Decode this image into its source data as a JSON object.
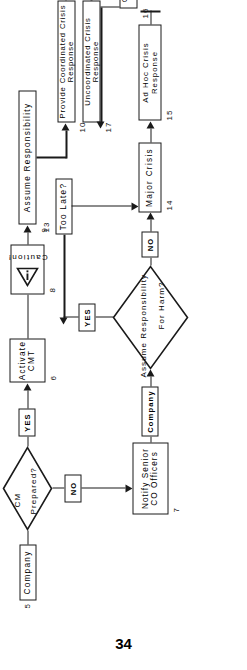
{
  "document": {
    "page_number": "34",
    "type": "flowchart",
    "orientation": "landscape-rotated"
  },
  "flowchart": {
    "nodes": [
      {
        "id": "5",
        "num": "5",
        "label": "Company",
        "shape": "rectangle"
      },
      {
        "id": "d1",
        "num": "",
        "label": "CM Prepared?",
        "shape": "diamond",
        "line1": "CM",
        "line2": "Prepared?"
      },
      {
        "id": "6",
        "num": "6",
        "label": "Activate CMT",
        "shape": "rectangle",
        "line1": "Activate",
        "line2": "CMT"
      },
      {
        "id": "8",
        "num": "8",
        "label": "Caution!",
        "shape": "rectangle-icon",
        "icon": "caution-triangle-icon"
      },
      {
        "id": "9",
        "num": "9",
        "label": "Assume Responsibility",
        "shape": "rectangle"
      },
      {
        "id": "10",
        "num": "10",
        "label": "Provide Coordinated Crisis Response",
        "shape": "rectangle"
      },
      {
        "id": "11",
        "num": "11",
        "label": "2",
        "shape": "connector-arrow",
        "icon": "up-arrow-icon"
      },
      {
        "id": "7",
        "num": "7",
        "label": "Notify Senior CO Officers",
        "shape": "rectangle",
        "line1": "Notify  Senior",
        "line2": "CO Officers"
      },
      {
        "id": "d2",
        "num": "",
        "label": "Assume Responsibility For Harm?",
        "shape": "diamond",
        "line1": "Assume Responsibility",
        "line2": "For Harm?"
      },
      {
        "id": "13",
        "num": "13",
        "label": "Too Late?",
        "shape": "rectangle"
      },
      {
        "id": "14",
        "num": "14",
        "label": "Major Crisis",
        "shape": "rectangle"
      },
      {
        "id": "15",
        "num": "15",
        "label": "Ad Hoc Crisis Response",
        "shape": "rectangle"
      },
      {
        "id": "16",
        "num": "16",
        "label": "Chain Reaction of Further Crises?",
        "shape": "rectangle"
      },
      {
        "id": "17",
        "num": "17",
        "label": "Uncoordinated Crisis Response",
        "shape": "rectangle"
      }
    ],
    "edge_labels": [
      {
        "id": "yes1",
        "label": "YES",
        "from": "d1",
        "to": "6"
      },
      {
        "id": "no1",
        "label": "NO",
        "from": "d1",
        "to": "7"
      },
      {
        "id": "company",
        "label": "Company",
        "from": "7",
        "to": "d2"
      },
      {
        "id": "yes2",
        "label": "YES",
        "from": "d2",
        "to": "13"
      },
      {
        "id": "no2",
        "label": "NO",
        "from": "d2",
        "to": "14"
      }
    ]
  },
  "colors": {
    "ink": "#1a1a1a",
    "paper": "#ffffff"
  }
}
